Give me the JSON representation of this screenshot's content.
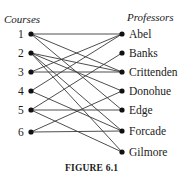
{
  "diagram": {
    "left_header": "Courses",
    "right_header": "Professors",
    "caption": "FIGURE 6.1",
    "courses": [
      {
        "label": "1",
        "y": 34
      },
      {
        "label": "2",
        "y": 53
      },
      {
        "label": "3",
        "y": 72
      },
      {
        "label": "4",
        "y": 91
      },
      {
        "label": "5",
        "y": 110
      },
      {
        "label": "6",
        "y": 132
      }
    ],
    "professors": [
      {
        "label": "Abel",
        "y": 34
      },
      {
        "label": "Banks",
        "y": 53
      },
      {
        "label": "Crittenden",
        "y": 72
      },
      {
        "label": "Donohue",
        "y": 91
      },
      {
        "label": "Edge",
        "y": 110
      },
      {
        "label": "Forcade",
        "y": 131
      },
      {
        "label": "Gilmore",
        "y": 152
      }
    ],
    "edges": [
      [
        "1",
        "Abel"
      ],
      [
        "1",
        "Crittenden"
      ],
      [
        "1",
        "Edge"
      ],
      [
        "2",
        "Crittenden"
      ],
      [
        "2",
        "Donohue"
      ],
      [
        "2",
        "Forcade"
      ],
      [
        "2",
        "Gilmore"
      ],
      [
        "3",
        "Abel"
      ],
      [
        "3",
        "Crittenden"
      ],
      [
        "4",
        "Abel"
      ],
      [
        "4",
        "Forcade"
      ],
      [
        "5",
        "Banks"
      ],
      [
        "5",
        "Edge"
      ],
      [
        "5",
        "Gilmore"
      ],
      [
        "6",
        "Donohue"
      ],
      [
        "6",
        "Forcade"
      ]
    ]
  }
}
